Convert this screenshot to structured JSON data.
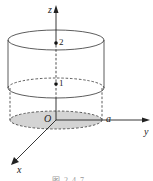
{
  "figure": {
    "type": "cylinder-coordinate-diagram",
    "axes": {
      "z_label": "z",
      "y_label": "y",
      "x_label": "x",
      "origin_label": "O"
    },
    "points": [
      {
        "label": "2"
      },
      {
        "label": "1"
      }
    ],
    "radius_label": "a",
    "base_fill_color": "#d4d4d4",
    "line_color": "#222222",
    "caption": "图 2.4.7"
  }
}
